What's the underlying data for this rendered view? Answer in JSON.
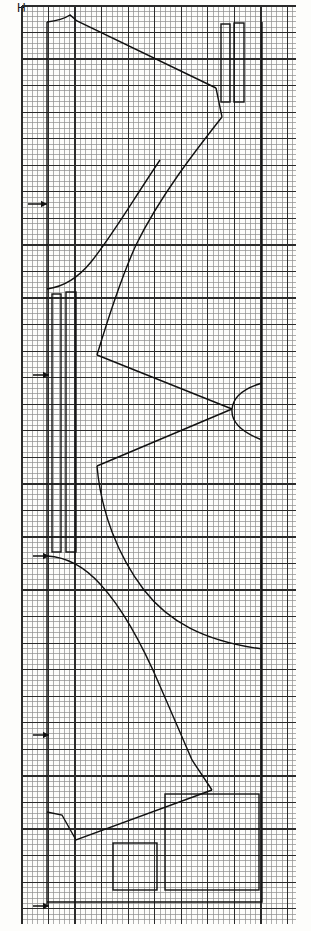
{
  "page": {
    "width": 311,
    "height": 931,
    "background_color": "#fdfdfb",
    "corner_label": "H"
  },
  "grid": {
    "minor_color": "#8d8d8d",
    "major_color": "#2b2b2b",
    "minor_step_px": 5.31,
    "major_every": 5,
    "left": 22,
    "top": 6,
    "right": 296,
    "bottom": 924,
    "minor_cols": 52,
    "minor_rows": 173
  },
  "ink": {
    "line_color": "#111111",
    "thin_width": 1.4,
    "thick_width": 2.1
  },
  "markers": {
    "arrow_label": "arrow",
    "arrows": [
      {
        "x_tail": 28,
        "x_head": 47,
        "y": 204
      },
      {
        "x_tail": 33,
        "x_head": 49,
        "y": 375
      },
      {
        "x_tail": 33,
        "x_head": 49,
        "y": 556
      },
      {
        "x_tail": 33,
        "x_head": 49,
        "y": 735
      },
      {
        "x_tail": 33,
        "x_head": 49,
        "y": 906
      }
    ]
  },
  "chart_data": {
    "type": "line",
    "xlabel": "",
    "ylabel": "",
    "grid": true,
    "legend": false,
    "axis_ranges": {
      "x": [
        22,
        296
      ],
      "y": [
        6,
        924
      ]
    },
    "annotations": [
      {
        "text": "H",
        "x": 18,
        "y": 5,
        "role": "sheet-corner-label"
      },
      {
        "text": "arrow",
        "x": 28,
        "y": 204,
        "role": "left-tick-arrow"
      },
      {
        "text": "arrow",
        "x": 33,
        "y": 375,
        "role": "left-tick-arrow"
      },
      {
        "text": "arrow",
        "x": 33,
        "y": 556,
        "role": "left-tick-arrow"
      },
      {
        "text": "arrow",
        "x": 33,
        "y": 735,
        "role": "left-tick-arrow"
      },
      {
        "text": "arrow",
        "x": 33,
        "y": 906,
        "role": "left-tick-arrow"
      }
    ],
    "series": [
      {
        "name": "left-spine",
        "kind": "polyline",
        "closed": false,
        "points": [
          [
            47,
            22
          ],
          [
            47,
            906
          ]
        ]
      },
      {
        "name": "right-spine",
        "kind": "polyline",
        "closed": false,
        "points": [
          [
            262,
            22
          ],
          [
            262,
            889
          ]
        ]
      },
      {
        "name": "top-ridge",
        "kind": "path",
        "d": "M 47 22 C 56 21 64 19 70 15 L 77 21 L 216 88"
      },
      {
        "name": "upper-right-fall",
        "kind": "polyline",
        "closed": false,
        "points": [
          [
            216,
            88
          ],
          [
            222,
            117
          ]
        ]
      },
      {
        "name": "upper-concave-curve",
        "kind": "path",
        "d": "M 222 117 C 196 150 160 196 136 245 C 120 280 107 322 97 355"
      },
      {
        "name": "left-bay-curve",
        "kind": "path",
        "d": "M 47 289 C 62 287 78 278 91 262 C 112 236 133 200 160 160"
      },
      {
        "name": "mid-wedge-upper",
        "kind": "polyline",
        "closed": false,
        "points": [
          [
            97,
            355
          ],
          [
            232,
            409
          ]
        ]
      },
      {
        "name": "mid-wedge-lower",
        "kind": "polyline",
        "closed": false,
        "points": [
          [
            232,
            409
          ],
          [
            97,
            466
          ]
        ]
      },
      {
        "name": "notch-arc-right",
        "kind": "path",
        "d": "M 262 383 C 242 389 233 398 232 409 C 231 421 241 432 262 440"
      },
      {
        "name": "lower-bay-curve",
        "kind": "path",
        "d": "M 97 466 C 101 512 118 556 144 590 C 168 621 203 641 262 649"
      },
      {
        "name": "lower-left-curve",
        "kind": "path",
        "d": "M 47 556 C 67 557 85 567 101 585 C 122 608 142 644 160 686"
      },
      {
        "name": "lower-wedge-right",
        "kind": "polyline",
        "closed": false,
        "points": [
          [
            160,
            686
          ],
          [
            192,
            760
          ],
          [
            212,
            790
          ]
        ]
      },
      {
        "name": "bottom-notch",
        "kind": "polyline",
        "closed": false,
        "points": [
          [
            212,
            790
          ],
          [
            76,
            840
          ],
          [
            62,
            815
          ],
          [
            47,
            812
          ]
        ]
      },
      {
        "name": "bottom-rail",
        "kind": "polyline",
        "closed": false,
        "points": [
          [
            47,
            902
          ],
          [
            262,
            902
          ],
          [
            262,
            889
          ]
        ]
      }
    ],
    "rectangles": [
      {
        "name": "top-bar-left",
        "x": 221,
        "y": 24,
        "w": 9,
        "h": 78
      },
      {
        "name": "top-bar-right",
        "x": 234,
        "y": 23,
        "w": 10,
        "h": 79
      },
      {
        "name": "mid-bar-left",
        "x": 52,
        "y": 294,
        "w": 9,
        "h": 258
      },
      {
        "name": "mid-bar-right",
        "x": 66,
        "y": 292,
        "w": 10,
        "h": 260
      },
      {
        "name": "small-square",
        "x": 113,
        "y": 843,
        "w": 44,
        "h": 47
      },
      {
        "name": "large-square",
        "x": 165,
        "y": 794,
        "w": 94,
        "h": 96
      }
    ]
  }
}
